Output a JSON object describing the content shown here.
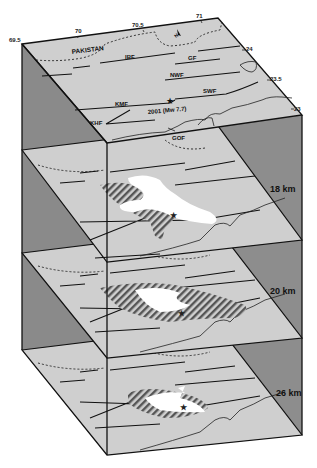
{
  "figure": {
    "type": "3D block diagram of crustal layers",
    "colors": {
      "plate": "#cfcfcf",
      "side_face": "#8c8c8c",
      "side_face_dark": "#7a7a7a",
      "edge": "#111111",
      "anomaly_white": "#ffffff",
      "hatch": "#555555"
    },
    "top_plate": {
      "longitude_ticks": [
        "69.5",
        "70",
        "70.5",
        "71"
      ],
      "latitude_ticks": [
        "24",
        "23.5",
        "23"
      ],
      "country_label": "PAKISTAN",
      "north_arrow_label": "N",
      "faults": [
        "IBF",
        "GF",
        "NWF",
        "SWF",
        "KMF",
        "KHF",
        "GOF"
      ],
      "event_label": "2001 (Mw 7.7)",
      "epicenter_marker": "star"
    },
    "layers": [
      {
        "depth_label": "18 km"
      },
      {
        "depth_label": "20 km"
      },
      {
        "depth_label": "26 km"
      }
    ]
  }
}
